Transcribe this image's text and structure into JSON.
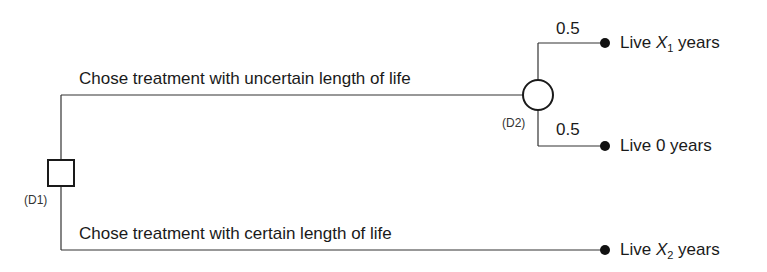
{
  "diagram": {
    "type": "decision-tree",
    "nodes": {
      "decision": {
        "id_label": "(D1)",
        "shape": "square"
      },
      "chance": {
        "id_label": "(D2)",
        "shape": "circle"
      }
    },
    "branches": {
      "uncertain": {
        "label": "Chose treatment with uncertain length of life"
      },
      "certain": {
        "label": "Chose treatment with certain length of life"
      }
    },
    "chance_branches": [
      {
        "probability": "0.5",
        "outcome_prefix": "Live ",
        "outcome_var": "X",
        "outcome_sub": "1",
        "outcome_suffix": " years"
      },
      {
        "probability": "0.5",
        "outcome_text": "Live 0 years"
      }
    ],
    "certain_outcome": {
      "outcome_prefix": "Live ",
      "outcome_var": "X",
      "outcome_sub": "2",
      "outcome_suffix": " years"
    },
    "colors": {
      "line": "#333333",
      "node_fill": "#ffffff",
      "terminal": "#111111"
    }
  }
}
